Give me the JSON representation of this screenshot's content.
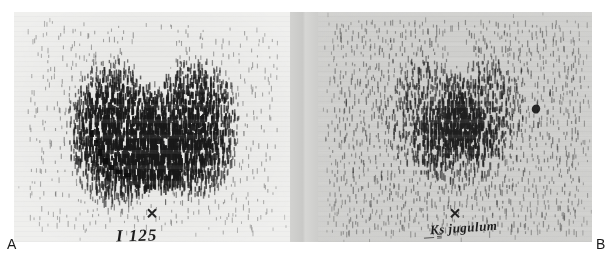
{
  "figure": {
    "kind": "thyroid-scintigram-pair",
    "background_color": "#ffffff",
    "width": 614,
    "height": 258
  },
  "panels": [
    {
      "id": "A",
      "letter": "A",
      "tracer_label": "I 125",
      "tracer_label_isotope": "I",
      "tracer_label_mass": "125",
      "film_tint": "#e9e9e7",
      "description": "Rectilinear dot scan of thyroid gland showing symmetric butterfly shaped uptake with two lobes and isthmus",
      "marker_glyph": "x"
    },
    {
      "id": "B",
      "letter": "B",
      "annotation_label": "Ks jugulum",
      "annotation_sub": "— ≡",
      "film_tint": "#cfcfcd",
      "description": "Rectilinear dot scan with diffuse lower contrast uptake, jugular notch reference marked",
      "marker_glyph": "x"
    }
  ],
  "captions": {
    "left_letter": "A",
    "right_letter": "B"
  },
  "colors": {
    "paper": "#ffffff",
    "film_light": "#e9e9e7",
    "film_dark": "#cfcfcd",
    "gutter": "#d2d2d0",
    "dot_ink": "#1b1b1b",
    "caption_text": "#1a1a1a"
  },
  "chart_data": {
    "type": "heatmap",
    "title": "",
    "xlabel": "",
    "ylabel": "",
    "panels": [
      {
        "name": "A",
        "label": "I 125",
        "grid": {
          "cols": 46,
          "rows": 30
        },
        "peak_intensity": 1.0,
        "background_intensity": 0.12,
        "shape": "bilobed-butterfly",
        "lobes": [
          {
            "cx": 0.36,
            "cy": 0.52,
            "rx": 0.18,
            "ry": 0.34,
            "weight": 1.0
          },
          {
            "cx": 0.64,
            "cy": 0.5,
            "rx": 0.18,
            "ry": 0.32,
            "weight": 0.97
          }
        ],
        "isthmus": {
          "cx": 0.5,
          "cy": 0.62,
          "rx": 0.12,
          "ry": 0.16,
          "weight": 0.82
        },
        "notch": {
          "cx": 0.5,
          "cy": 0.18,
          "rx": 0.08,
          "ry": 0.14,
          "weight": -0.85
        }
      },
      {
        "name": "B",
        "label": "Ks jugulum",
        "grid": {
          "cols": 46,
          "rows": 30
        },
        "peak_intensity": 0.62,
        "background_intensity": 0.26,
        "shape": "diffuse-bilobed",
        "lobes": [
          {
            "cx": 0.4,
            "cy": 0.44,
            "rx": 0.16,
            "ry": 0.26,
            "weight": 0.7
          },
          {
            "cx": 0.6,
            "cy": 0.42,
            "rx": 0.15,
            "ry": 0.24,
            "weight": 0.74
          }
        ],
        "isthmus": {
          "cx": 0.5,
          "cy": 0.56,
          "rx": 0.16,
          "ry": 0.2,
          "weight": 0.6
        },
        "notch": {
          "cx": 0.5,
          "cy": 0.16,
          "rx": 0.07,
          "ry": 0.12,
          "weight": -0.4
        }
      }
    ]
  }
}
